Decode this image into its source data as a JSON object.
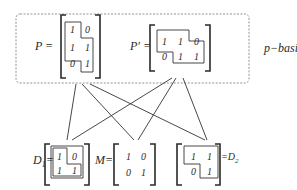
{
  "group": {
    "label": "p−basis",
    "style": "dashed rounded box"
  },
  "matrices": {
    "P": {
      "label": "P =",
      "rows": [
        [
          "1",
          "0"
        ],
        [
          "1",
          "1"
        ],
        [
          "0",
          "1"
        ]
      ]
    },
    "P_prime": {
      "label": "P′ =",
      "rows": [
        [
          "1",
          "1",
          "0"
        ],
        [
          "0",
          "1",
          "1"
        ]
      ]
    },
    "D1": {
      "label": "D",
      "subscript": "1",
      "eq": "=",
      "rows": [
        [
          "1",
          "0"
        ],
        [
          "1",
          "1"
        ]
      ]
    },
    "M": {
      "label": "M=",
      "rows": [
        [
          "1",
          "0"
        ],
        [
          "0",
          "1"
        ]
      ]
    },
    "D2": {
      "label": "=D",
      "subscript": "2",
      "rows": [
        [
          "1",
          "1"
        ],
        [
          "0",
          "1"
        ]
      ]
    }
  },
  "edges": [
    {
      "from": "P",
      "to": "D1"
    },
    {
      "from": "P",
      "to": "M"
    },
    {
      "from": "P",
      "to": "D2"
    },
    {
      "from": "P_prime",
      "to": "D1"
    },
    {
      "from": "P_prime",
      "to": "M"
    },
    {
      "from": "P_prime",
      "to": "D2"
    }
  ]
}
